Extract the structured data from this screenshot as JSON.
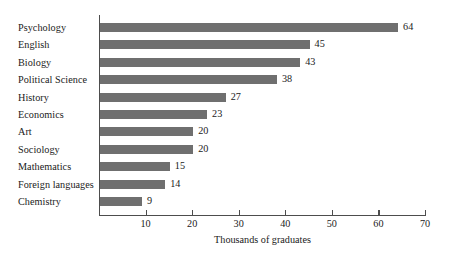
{
  "chart_data": {
    "type": "bar",
    "orientation": "horizontal",
    "title": "",
    "xlabel": "Thousands of graduates",
    "ylabel": "",
    "categories": [
      "Psychology",
      "English",
      "Biology",
      "Political Science",
      "History",
      "Economics",
      "Art",
      "Sociology",
      "Mathematics",
      "Foreign languages",
      "Chemistry"
    ],
    "values": [
      64,
      45,
      43,
      38,
      27,
      23,
      20,
      20,
      15,
      14,
      9
    ],
    "value_labels": [
      "64",
      "45",
      "43",
      "38",
      "27",
      "23",
      "20",
      "20",
      "15",
      "14",
      "9"
    ],
    "xlim": [
      0,
      70
    ],
    "xticks": [
      10,
      20,
      30,
      40,
      50,
      60,
      70
    ],
    "xtick_labels": [
      "10",
      "20",
      "30",
      "40",
      "50",
      "60",
      "70"
    ],
    "grid": false,
    "legend": false,
    "bar_color": "#6f6f6f",
    "axis_color": "#4d4d4d",
    "background_color": "#ffffff",
    "text_color": "#1a1a1a"
  }
}
